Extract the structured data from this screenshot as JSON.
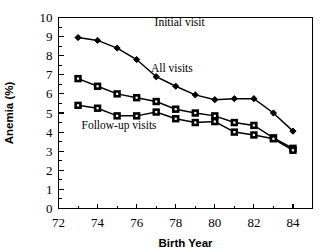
{
  "chart_data": {
    "type": "line",
    "title": "",
    "xlabel": "Birth Year",
    "ylabel": "Anemia (%)",
    "xlim": [
      72,
      85
    ],
    "ylim": [
      0,
      10
    ],
    "grid": false,
    "legend_position": "inline-annotations",
    "x": [
      73,
      74,
      75,
      76,
      77,
      78,
      79,
      80,
      81,
      82,
      83,
      84
    ],
    "xticks": [
      72,
      74,
      76,
      78,
      80,
      82,
      84
    ],
    "xtick_labels": [
      "72",
      "74",
      "76",
      "78",
      "80",
      "82",
      "84"
    ],
    "xminor_ticks": [
      73,
      75,
      77,
      79,
      81,
      83,
      85
    ],
    "yticks": [
      0,
      1,
      2,
      3,
      4,
      5,
      6,
      7,
      8,
      9,
      10
    ],
    "ytick_labels": [
      "0",
      "1",
      "2",
      "3",
      "4",
      "5",
      "6",
      "7",
      "8",
      "9",
      "10"
    ],
    "series": [
      {
        "name": "Initial visit",
        "marker": "filled-diamond",
        "label_x": 78.2,
        "label_y": 9.75,
        "values": [
          8.95,
          8.8,
          8.4,
          7.8,
          6.9,
          6.4,
          5.95,
          5.7,
          5.75,
          5.75,
          5.0,
          4.05
        ]
      },
      {
        "name": "All visits",
        "marker": "open-square",
        "label_x": 77.8,
        "label_y": 7.35,
        "values": [
          6.8,
          6.4,
          6.0,
          5.8,
          5.6,
          5.2,
          5.0,
          4.85,
          4.5,
          4.35,
          3.7,
          3.15
        ]
      },
      {
        "name": "Follow-up visits",
        "marker": "open-square",
        "label_x": 75.1,
        "label_y": 4.35,
        "values": [
          5.4,
          5.25,
          4.85,
          4.85,
          5.05,
          4.7,
          4.5,
          4.55,
          4.0,
          3.85,
          3.65,
          3.05
        ]
      }
    ]
  }
}
